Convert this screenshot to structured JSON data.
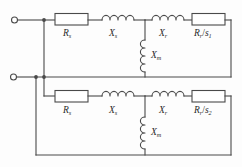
{
  "figure": {
    "name": "induction-machine-dual-slip-equivalent-circuit",
    "stroke_color": "#4a4a4a",
    "background_color": "#fdfdfd",
    "label_color": "#2b2b2b"
  },
  "branches": {
    "upper": {
      "stator_resistance": {
        "symbol": "R",
        "subscript": "s"
      },
      "stator_reactance": {
        "symbol": "X",
        "subscript": "s"
      },
      "magnetizing_reactance": {
        "symbol": "X",
        "subscript": "m"
      },
      "rotor_reactance": {
        "symbol": "X",
        "subscript": "r"
      },
      "rotor_resistance_over_slip": {
        "symbol": "R",
        "subscript": "r",
        "divider": "/",
        "slip_symbol": "s",
        "slip_subscript": "1"
      }
    },
    "lower": {
      "stator_resistance": {
        "symbol": "R",
        "subscript": "s"
      },
      "stator_reactance": {
        "symbol": "X",
        "subscript": "s"
      },
      "magnetizing_reactance": {
        "symbol": "X",
        "subscript": "m"
      },
      "rotor_reactance": {
        "symbol": "X",
        "subscript": "r"
      },
      "rotor_resistance_over_slip": {
        "symbol": "R",
        "subscript": "r",
        "divider": "/",
        "slip_symbol": "s",
        "slip_subscript": "2"
      }
    }
  },
  "terminals": {
    "top": "input-terminal-top",
    "bottom": "input-terminal-bottom"
  }
}
